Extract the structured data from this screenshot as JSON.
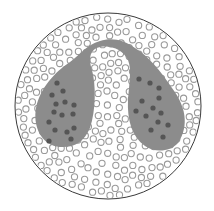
{
  "canvas": {
    "width": 214,
    "height": 211,
    "background": "#ffffff"
  },
  "colors": {
    "outline": "#3a3a3a",
    "body_fill": "#8c8c8c",
    "granule_dark": "#555555",
    "bubble_stroke": "#9a9a9a",
    "bubble_fill": "#ffffff"
  },
  "outer_circle": {
    "cx": 108,
    "cy": 106,
    "r": 93
  },
  "structure": {
    "name": "two-lobed gland connected by arch",
    "path": "M 60 147 C 40 145 33 125 36 108 C 40 88 55 72 70 62 C 80 55 86 45 100 41 C 112 37 124 40 135 48 C 148 56 160 70 172 88 C 185 105 190 125 178 143 C 170 152 155 153 145 146 C 132 137 127 120 128 100 C 129 85 132 70 128 60 C 123 50 112 45 100 47 C 90 49 88 58 92 70 C 96 85 96 110 90 128 C 84 142 74 148 60 147 Z"
  },
  "granules": [
    [
      57,
      83
    ],
    [
      63,
      91
    ],
    [
      52,
      95
    ],
    [
      56,
      104
    ],
    [
      65,
      102
    ],
    [
      74,
      105
    ],
    [
      54,
      112
    ],
    [
      62,
      115
    ],
    [
      73,
      114
    ],
    [
      49,
      122
    ],
    [
      55,
      130
    ],
    [
      67,
      132
    ],
    [
      74,
      128
    ],
    [
      49,
      141
    ],
    [
      71,
      139
    ],
    [
      139,
      79
    ],
    [
      150,
      83
    ],
    [
      159,
      88
    ],
    [
      159,
      98
    ],
    [
      142,
      101
    ],
    [
      153,
      108
    ],
    [
      161,
      113
    ],
    [
      136,
      111
    ],
    [
      146,
      116
    ],
    [
      158,
      122
    ],
    [
      168,
      125
    ],
    [
      151,
      130
    ],
    [
      163,
      137
    ]
  ],
  "granule_radius": 2.6,
  "bubble_radius": 3.1,
  "bubble_seed": 7,
  "bubble_count": 520
}
